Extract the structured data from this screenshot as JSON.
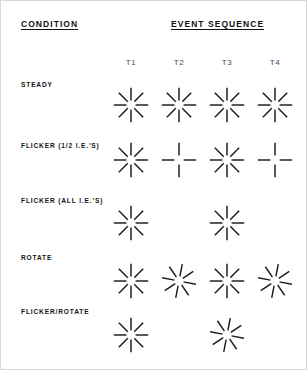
{
  "figure": {
    "headings": {
      "condition": "CONDITION",
      "event_sequence": "EVENT SEQUENCE"
    },
    "column_headers": [
      {
        "label": "T1",
        "x": 118
      },
      {
        "label": "T2",
        "x": 166
      },
      {
        "label": "T3",
        "x": 214
      },
      {
        "label": "T4",
        "x": 262
      }
    ],
    "ink_color": "#1b1b1b",
    "background_color": "#ffffff",
    "rows": [
      {
        "label": "STEADY",
        "label_y": 80,
        "row_y": 82,
        "cells": [
          {
            "time": "T1",
            "shown": true,
            "spokes": 8,
            "rotation": 0
          },
          {
            "time": "T2",
            "shown": true,
            "spokes": 8,
            "rotation": 0
          },
          {
            "time": "T3",
            "shown": true,
            "spokes": 8,
            "rotation": 0
          },
          {
            "time": "T4",
            "shown": true,
            "spokes": 8,
            "rotation": 0
          }
        ]
      },
      {
        "label": "FLICKER (1/2 I.E.'S)",
        "label_y": 141,
        "row_y": 137,
        "cells": [
          {
            "time": "T1",
            "shown": true,
            "spokes": 8,
            "rotation": 0
          },
          {
            "time": "T2",
            "shown": true,
            "spokes": 4,
            "rotation": 0
          },
          {
            "time": "T3",
            "shown": true,
            "spokes": 8,
            "rotation": 0
          },
          {
            "time": "T4",
            "shown": true,
            "spokes": 4,
            "rotation": 0
          }
        ]
      },
      {
        "label": "FLICKER (ALL I.E.'S)",
        "label_y": 196,
        "row_y": 200,
        "cells": [
          {
            "time": "T1",
            "shown": true,
            "spokes": 8,
            "rotation": 0
          },
          {
            "time": "T2",
            "shown": false,
            "spokes": 0,
            "rotation": 0
          },
          {
            "time": "T3",
            "shown": true,
            "spokes": 8,
            "rotation": 0
          },
          {
            "time": "T4",
            "shown": false,
            "spokes": 0,
            "rotation": 0
          }
        ]
      },
      {
        "label": "ROTATE",
        "label_y": 253,
        "row_y": 258,
        "cells": [
          {
            "time": "T1",
            "shown": true,
            "spokes": 8,
            "rotation": 0
          },
          {
            "time": "T2",
            "shown": true,
            "spokes": 8,
            "rotation": 11
          },
          {
            "time": "T3",
            "shown": true,
            "spokes": 8,
            "rotation": 0
          },
          {
            "time": "T4",
            "shown": true,
            "spokes": 8,
            "rotation": 11
          }
        ]
      },
      {
        "label": "FLICKER/ROTATE",
        "label_y": 307,
        "row_y": 312,
        "cells": [
          {
            "time": "T1",
            "shown": true,
            "spokes": 8,
            "rotation": 0
          },
          {
            "time": "T2",
            "shown": false,
            "spokes": 0,
            "rotation": 0
          },
          {
            "time": "T3",
            "shown": true,
            "spokes": 8,
            "rotation": 11
          },
          {
            "time": "T4",
            "shown": false,
            "spokes": 0,
            "rotation": 0
          }
        ]
      }
    ]
  }
}
